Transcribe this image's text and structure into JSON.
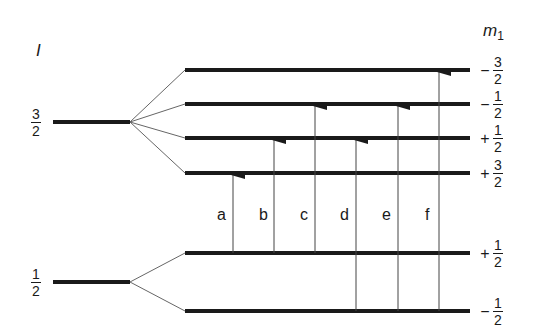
{
  "axis_labels": {
    "left": "I",
    "right_main": "m",
    "right_sub": "1"
  },
  "left_levels": [
    {
      "num": "3",
      "den": "2"
    },
    {
      "num": "1",
      "den": "2"
    }
  ],
  "right_levels": [
    {
      "sign": "−",
      "num": "3",
      "den": "2"
    },
    {
      "sign": "−",
      "num": "1",
      "den": "2"
    },
    {
      "sign": "+",
      "num": "1",
      "den": "2"
    },
    {
      "sign": "+",
      "num": "3",
      "den": "2"
    },
    {
      "sign": "+",
      "num": "1",
      "den": "2"
    },
    {
      "sign": "−",
      "num": "1",
      "den": "2"
    }
  ],
  "transitions": [
    {
      "label": "a",
      "from": "+1/2",
      "to": "+3/2"
    },
    {
      "label": "b",
      "from": "+1/2",
      "to": "+1/2"
    },
    {
      "label": "c",
      "from": "+1/2",
      "to": "−1/2"
    },
    {
      "label": "d",
      "from": "−1/2",
      "to": "+1/2"
    },
    {
      "label": "e",
      "from": "−1/2",
      "to": "−1/2"
    },
    {
      "label": "f",
      "from": "−1/2",
      "to": "−3/2"
    }
  ],
  "colors": {
    "line": "#1a1a1a",
    "thin": "#555555"
  }
}
